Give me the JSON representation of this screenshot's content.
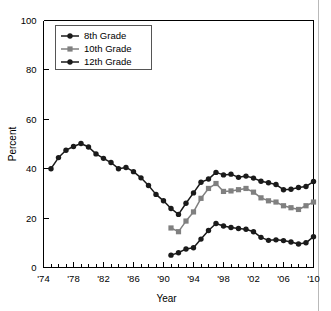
{
  "chart_data": {
    "type": "line",
    "title": "",
    "subtitle": "",
    "xlabel": "Year",
    "ylabel": "Percent",
    "xlim": [
      1974,
      2010
    ],
    "ylim": [
      0,
      100
    ],
    "grid": false,
    "legend_position": "top-left",
    "y_ticks": [
      0,
      20,
      40,
      60,
      80,
      100
    ],
    "y_tick_labels": [
      "0",
      "20",
      "40",
      "60",
      "80",
      "100"
    ],
    "x_ticks": [
      1974,
      1975,
      1976,
      1977,
      1978,
      1979,
      1980,
      1981,
      1982,
      1983,
      1984,
      1985,
      1986,
      1987,
      1988,
      1989,
      1990,
      1991,
      1992,
      1993,
      1994,
      1995,
      1996,
      1997,
      1998,
      1999,
      2000,
      2001,
      2002,
      2003,
      2004,
      2005,
      2006,
      2007,
      2008,
      2009,
      2010
    ],
    "x_tick_labels": [
      "'74",
      "'78",
      "'82",
      "'86",
      "'90",
      "'94",
      "'98",
      "'02",
      "'06",
      "'10"
    ],
    "x_tick_label_years": [
      1974,
      1978,
      1982,
      1986,
      1990,
      1994,
      1998,
      2002,
      2006,
      2010
    ],
    "series": [
      {
        "name": "8th Grade",
        "color": "#1a1a1a",
        "marker": "circle",
        "x": [
          1991,
          1992,
          1993,
          1994,
          1995,
          1996,
          1997,
          1998,
          1999,
          2000,
          2001,
          2002,
          2003,
          2004,
          2005,
          2006,
          2007,
          2008,
          2009,
          2010
        ],
        "values": [
          5.0,
          6.0,
          7.5,
          8.0,
          11.5,
          15.0,
          17.8,
          16.8,
          16.2,
          15.8,
          15.5,
          14.5,
          12.2,
          11.0,
          11.2,
          10.9,
          10.3,
          9.5,
          10.0,
          12.5
        ]
      },
      {
        "name": "10th Grade",
        "color": "#808080",
        "marker": "square",
        "x": [
          1991,
          1992,
          1993,
          1994,
          1995,
          1996,
          1997,
          1998,
          1999,
          2000,
          2001,
          2002,
          2003,
          2004,
          2005,
          2006,
          2007,
          2008,
          2009,
          2010
        ],
        "values": [
          16.0,
          14.5,
          18.8,
          22.5,
          28.0,
          32.0,
          34.0,
          30.8,
          31.0,
          31.5,
          32.0,
          30.5,
          28.2,
          27.0,
          26.5,
          25.0,
          24.2,
          23.5,
          25.0,
          26.5
        ]
      },
      {
        "name": "12th Grade",
        "color": "#1a1a1a",
        "marker": "circle",
        "x": [
          1975,
          1976,
          1977,
          1978,
          1979,
          1980,
          1981,
          1982,
          1983,
          1984,
          1985,
          1986,
          1987,
          1988,
          1989,
          1990,
          1991,
          1992,
          1993,
          1994,
          1995,
          1996,
          1997,
          1998,
          1999,
          2000,
          2001,
          2002,
          2003,
          2004,
          2005,
          2006,
          2007,
          2008,
          2009,
          2010
        ],
        "values": [
          40.0,
          44.5,
          47.5,
          49.0,
          50.2,
          48.8,
          46.0,
          44.2,
          42.5,
          40.0,
          40.5,
          38.8,
          36.3,
          33.2,
          29.6,
          27.0,
          23.9,
          21.5,
          26.0,
          30.2,
          34.5,
          35.8,
          38.5,
          37.5,
          37.8,
          36.5,
          37.0,
          36.2,
          34.9,
          34.3,
          33.6,
          31.5,
          31.7,
          32.4,
          32.8,
          34.8
        ]
      }
    ]
  },
  "legend": {
    "items": [
      {
        "label": "8th Grade"
      },
      {
        "label": "10th Grade"
      },
      {
        "label": "12th Grade"
      }
    ]
  },
  "axes": {
    "x_title": "Year",
    "y_title": "Percent"
  }
}
